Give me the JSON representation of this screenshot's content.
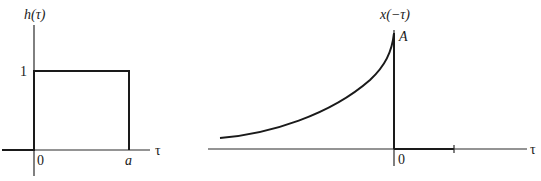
{
  "figure": {
    "left_plot": {
      "y_label": "h(τ)",
      "x_label": "τ",
      "level_label": "1",
      "origin_label": "0",
      "end_label": "a",
      "description": "rectangular pulse of height 1 from τ=0 to τ=a"
    },
    "right_plot": {
      "y_label": "x(−τ)",
      "x_label": "τ",
      "peak_label": "A",
      "origin_label": "0",
      "description": "time-reversed decaying exponential rising to A at τ=0, zero for τ>0"
    },
    "colors": {
      "ink": "#1a1a1a",
      "background": "#ffffff"
    }
  }
}
